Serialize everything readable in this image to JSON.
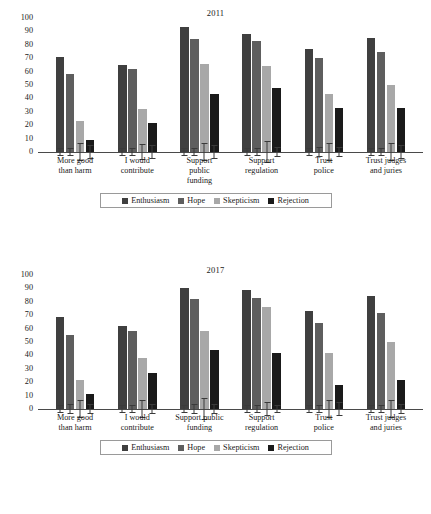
{
  "chart_data": [
    {
      "type": "bar",
      "title": "2011",
      "xlabel": "",
      "ylabel": "",
      "ylim": [
        0,
        100
      ],
      "yticks": [
        100,
        90,
        80,
        70,
        60,
        50,
        40,
        30,
        20,
        10,
        0
      ],
      "grid": false,
      "legend_position": "bottom",
      "categories": [
        "More good\nthan harm",
        "I would\ncontribute",
        "Support\npublic\nfunding",
        "Support\nregulation",
        "Trust\npolice",
        "Trust judges\nand juries"
      ],
      "series": [
        {
          "name": "Enthusiasm",
          "color": "#3f3f3f",
          "values": [
            71,
            65,
            93,
            88,
            77,
            85
          ],
          "errors": [
            3,
            3,
            3,
            3,
            3,
            3
          ]
        },
        {
          "name": "Hope",
          "color": "#5e5e5e",
          "values": [
            58,
            62,
            84,
            83,
            70,
            75
          ],
          "errors": [
            3,
            3,
            3,
            3,
            4,
            3
          ]
        },
        {
          "name": "Skepticism",
          "color": "#a8a8a8",
          "values": [
            23,
            32,
            66,
            64,
            43,
            50
          ],
          "errors": [
            7,
            6,
            7,
            8,
            7,
            7
          ]
        },
        {
          "name": "Rejection",
          "color": "#1a1a1a",
          "values": [
            9,
            22,
            43,
            48,
            33,
            33,
            33
          ],
          "errors": [
            5,
            5,
            5,
            4,
            4,
            5
          ]
        }
      ]
    },
    {
      "type": "bar",
      "title": "2017",
      "xlabel": "",
      "ylabel": "",
      "ylim": [
        0,
        100
      ],
      "yticks": [
        100,
        90,
        80,
        70,
        60,
        50,
        40,
        30,
        20,
        10,
        0
      ],
      "grid": false,
      "legend_position": "bottom",
      "categories": [
        "More good\nthan harm",
        "I would\ncontribute",
        "Support public\nfunding",
        "Support\nregulation",
        "Trust\npolice",
        "Trust judges\nand juries"
      ],
      "series": [
        {
          "name": "Enthusiasm",
          "color": "#3f3f3f",
          "values": [
            69,
            62,
            90,
            89,
            73,
            84
          ],
          "errors": [
            3,
            3,
            3,
            3,
            3,
            3
          ]
        },
        {
          "name": "Hope",
          "color": "#5e5e5e",
          "values": [
            55,
            58,
            82,
            83,
            64,
            72
          ],
          "errors": [
            4,
            3,
            4,
            3,
            3,
            3
          ]
        },
        {
          "name": "Skepticism",
          "color": "#a8a8a8",
          "values": [
            22,
            38,
            58,
            76,
            42,
            50
          ],
          "errors": [
            7,
            7,
            8,
            5,
            7,
            7
          ]
        },
        {
          "name": "Rejection",
          "color": "#1a1a1a",
          "values": [
            11,
            27,
            44,
            42,
            18,
            22
          ],
          "errors": [
            4,
            4,
            4,
            3,
            5,
            4
          ]
        }
      ]
    }
  ],
  "panels": [
    {
      "title": "2011",
      "yticks": [
        "100",
        "90",
        "80",
        "70",
        "60",
        "50",
        "40",
        "30",
        "20",
        "10",
        "0"
      ],
      "categories": [
        [
          "More good",
          "than harm"
        ],
        [
          "I would",
          "contribute"
        ],
        [
          "Support",
          "public",
          "funding"
        ],
        [
          "Support",
          "regulation"
        ],
        [
          "Trust",
          "police"
        ],
        [
          "Trust judges",
          "and juries"
        ]
      ],
      "legend": [
        {
          "label": "Enthusiasm",
          "color": "#3f3f3f"
        },
        {
          "label": "Hope",
          "color": "#5e5e5e"
        },
        {
          "label": "Skepticism",
          "color": "#a8a8a8"
        },
        {
          "label": "Rejection",
          "color": "#1a1a1a"
        }
      ]
    },
    {
      "title": "2017",
      "yticks": [
        "100",
        "90",
        "80",
        "70",
        "60",
        "50",
        "40",
        "30",
        "20",
        "10",
        "0"
      ],
      "categories": [
        [
          "More good",
          "than harm"
        ],
        [
          "I would",
          "contribute"
        ],
        [
          "Support public",
          "funding"
        ],
        [
          "Support",
          "regulation"
        ],
        [
          "Trust",
          "police"
        ],
        [
          "Trust judges",
          "and juries"
        ]
      ],
      "legend": [
        {
          "label": "Enthusiasm",
          "color": "#3f3f3f"
        },
        {
          "label": "Hope",
          "color": "#5e5e5e"
        },
        {
          "label": "Skepticism",
          "color": "#a8a8a8"
        },
        {
          "label": "Rejection",
          "color": "#1a1a1a"
        }
      ]
    }
  ]
}
